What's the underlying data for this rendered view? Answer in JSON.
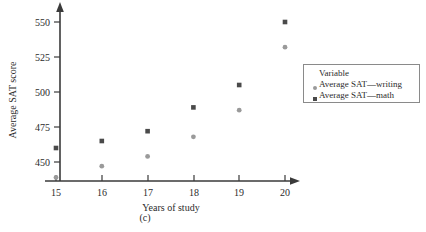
{
  "figure": {
    "caption": "(c)"
  },
  "chart_data": {
    "type": "scatter",
    "title": "",
    "xlabel": "Years of study",
    "ylabel": "Average SAT score",
    "x": [
      15,
      16,
      17,
      18,
      19,
      20
    ],
    "xticklabels": [
      "15",
      "16",
      "17",
      "18",
      "19",
      "20"
    ],
    "yticklabels": [
      "450",
      "475",
      "500",
      "525",
      "550"
    ],
    "yticks": [
      450,
      475,
      500,
      525,
      550
    ],
    "xlim": [
      14.6,
      20.4
    ],
    "ylim": [
      436,
      558
    ],
    "grid": false,
    "legend_position": "right",
    "legend_title": "Variable",
    "series": [
      {
        "name": "Average SAT—writing",
        "marker": "circle",
        "color": "#9a9a9a",
        "values": [
          439,
          447,
          454,
          468,
          487,
          532
        ]
      },
      {
        "name": "Average SAT—math",
        "marker": "square",
        "color": "#4a4a4a",
        "values": [
          460,
          465,
          472,
          489,
          505,
          550
        ]
      }
    ]
  },
  "axes": {
    "axis_color": "#3a3a3a"
  }
}
